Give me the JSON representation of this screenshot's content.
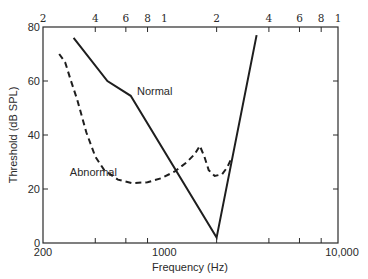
{
  "chart_data": {
    "type": "line",
    "title": "",
    "xlabel": "Frequency (Hz)",
    "ylabel": "Threshold (dB SPL)",
    "xscale": "log",
    "xlim": [
      200,
      10000
    ],
    "ylim": [
      0,
      80
    ],
    "grid": false,
    "x_ticks_bottom": {
      "major": [
        {
          "value": 200,
          "label": "200"
        },
        {
          "value": 1000,
          "label": "1000"
        },
        {
          "value": 10000,
          "label": "10,000"
        }
      ],
      "minor": [
        400,
        600,
        800,
        2000,
        4000,
        6000,
        8000
      ]
    },
    "x_ticks_top": [
      {
        "value": 200,
        "label": "2"
      },
      {
        "value": 400,
        "label": "4"
      },
      {
        "value": 600,
        "label": "6"
      },
      {
        "value": 800,
        "label": "8"
      },
      {
        "value": 1000,
        "label": "1"
      },
      {
        "value": 2000,
        "label": "2"
      },
      {
        "value": 4000,
        "label": "4"
      },
      {
        "value": 6000,
        "label": "6"
      },
      {
        "value": 8000,
        "label": "8"
      },
      {
        "value": 10000,
        "label": "1"
      }
    ],
    "y_ticks": [
      {
        "value": 0,
        "label": "0"
      },
      {
        "value": 20,
        "label": "20"
      },
      {
        "value": 40,
        "label": "40"
      },
      {
        "value": 60,
        "label": "60"
      },
      {
        "value": 80,
        "label": "80"
      }
    ],
    "series": [
      {
        "name": "Normal",
        "style": "solid",
        "label_at": {
          "x": 880,
          "y": 55
        },
        "points": [
          {
            "x": 300,
            "y": 76
          },
          {
            "x": 470,
            "y": 60
          },
          {
            "x": 640,
            "y": 54.5
          },
          {
            "x": 2000,
            "y": 2
          },
          {
            "x": 3400,
            "y": 77
          }
        ]
      },
      {
        "name": "Abnormal",
        "style": "dashed",
        "label_at": {
          "x": 390,
          "y": 25
        },
        "points": [
          {
            "x": 248,
            "y": 70
          },
          {
            "x": 268,
            "y": 67
          },
          {
            "x": 290,
            "y": 60
          },
          {
            "x": 315,
            "y": 53
          },
          {
            "x": 355,
            "y": 41
          },
          {
            "x": 400,
            "y": 32
          },
          {
            "x": 450,
            "y": 27
          },
          {
            "x": 540,
            "y": 23.5
          },
          {
            "x": 650,
            "y": 22.2
          },
          {
            "x": 800,
            "y": 22.5
          },
          {
            "x": 960,
            "y": 24
          },
          {
            "x": 1150,
            "y": 26.5
          },
          {
            "x": 1350,
            "y": 30
          },
          {
            "x": 1500,
            "y": 33
          },
          {
            "x": 1600,
            "y": 36
          },
          {
            "x": 1700,
            "y": 32
          },
          {
            "x": 1800,
            "y": 27
          },
          {
            "x": 1950,
            "y": 24.8
          },
          {
            "x": 2150,
            "y": 25.5
          },
          {
            "x": 2300,
            "y": 28
          },
          {
            "x": 2420,
            "y": 31
          }
        ]
      }
    ]
  }
}
